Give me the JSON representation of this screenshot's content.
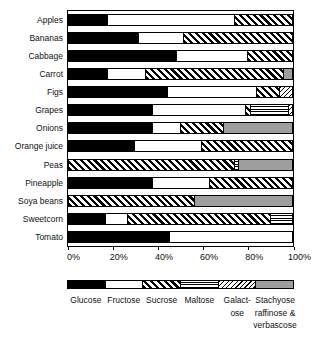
{
  "chart_data": {
    "type": "bar",
    "orientation": "horizontal",
    "stacked": true,
    "title": "",
    "xlabel": "",
    "ylabel": "",
    "xlim": [
      0,
      100
    ],
    "x_tick_labels": [
      "0%",
      "20%",
      "40%",
      "60%",
      "80%",
      "100%"
    ],
    "grid": false,
    "legend_position": "bottom",
    "categories": [
      "Apples",
      "Bananas",
      "Cabbage",
      "Carrot",
      "Figs",
      "Grapes",
      "Onions",
      "Orange juice",
      "Peas",
      "Pineapple",
      "Soya beans",
      "Sweetcorn",
      "Tomato"
    ],
    "series": [
      {
        "name": "Glucose",
        "key": "glucose",
        "values": [
          17,
          31,
          48,
          17,
          44,
          37,
          37,
          29,
          0,
          37,
          0,
          16,
          45
        ]
      },
      {
        "name": "Fructose",
        "key": "fructose",
        "values": [
          57,
          20,
          32,
          17,
          40,
          42,
          13,
          30,
          0,
          26,
          0,
          10,
          55
        ]
      },
      {
        "name": "Sucrose",
        "key": "sucrose",
        "values": [
          26,
          49,
          20,
          62,
          10,
          2,
          19,
          41,
          74,
          37,
          56,
          64,
          0
        ]
      },
      {
        "name": "Maltose",
        "key": "maltose",
        "values": [
          0,
          0,
          0,
          0,
          0,
          17,
          0,
          0,
          2,
          0,
          0,
          10,
          0
        ]
      },
      {
        "name": "Galactose",
        "key": "galactose",
        "values": [
          0,
          0,
          0,
          0,
          6,
          2,
          0,
          0,
          0,
          0,
          0,
          0,
          0
        ]
      },
      {
        "name": "Stachyose raffinose & verbascose",
        "key": "stachyose",
        "values": [
          0,
          0,
          0,
          4,
          0,
          0,
          31,
          0,
          24,
          0,
          44,
          0,
          0
        ]
      }
    ],
    "legend": [
      {
        "key": "glucose",
        "lines": [
          "Glucose"
        ]
      },
      {
        "key": "fructose",
        "lines": [
          "Fructose"
        ]
      },
      {
        "key": "sucrose",
        "lines": [
          "Sucrose"
        ]
      },
      {
        "key": "maltose",
        "lines": [
          "Maltose"
        ]
      },
      {
        "key": "galactose",
        "lines": [
          "Galact-",
          "ose"
        ]
      },
      {
        "key": "stachyose",
        "lines": [
          "Stachyose",
          "raffinose &",
          "verbascose"
        ]
      }
    ],
    "colors": {
      "glucose": "#000000",
      "fructose": "#ffffff",
      "sucrose_pattern": "bold-diagonal-stripes",
      "maltose_pattern": "horizontal-lines",
      "galactose_pattern": "thin-diagonal-stripes",
      "stachyose": "#9e9e9e",
      "ink": "#000000",
      "background": "#ffffff"
    }
  }
}
